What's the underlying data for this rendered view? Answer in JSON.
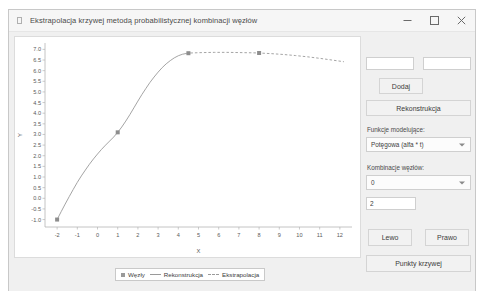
{
  "window": {
    "title": "Ekstrapolacja krzywej metodą probabilistycznej kombinacji węzłów",
    "minimize_label": "Minimalizuj",
    "maximize_label": "Maksymalizuj",
    "close_label": "Zamknij"
  },
  "controls": {
    "input_x_value": "",
    "input_x_placeholder": "",
    "input_y_value": "",
    "input_y_placeholder": "",
    "add_label": "Dodaj",
    "reconstruct_label": "Rekonstrukcja",
    "model_functions_label": "Funkcje modelujące:",
    "model_functions_selected": "Potęgowa (alfa * t)",
    "node_combinations_label": "Kombinacje węzłów:",
    "node_combinations_selected": "0",
    "count_value": "2",
    "count_placeholder": "",
    "left_label": "Lewo",
    "right_label": "Prawo",
    "curve_points_label": "Punkty krzywej"
  },
  "legend": {
    "nodes_label": "Węzły",
    "reconstruction_label": "Rekonstrukcja",
    "extrapolation_label": "Ekstrapolacja"
  },
  "colors": {
    "curve": "#9a9a9a",
    "marker": "#8d8d8d",
    "panel": "#f0f0f0",
    "plot_background": "#ffffff",
    "axis_text": "#5a5a5a"
  },
  "chart_data": {
    "type": "line",
    "title": "",
    "xlabel": "X",
    "ylabel": "Y",
    "xlim": [
      -2.6,
      12.6
    ],
    "ylim": [
      -1.35,
      7.3
    ],
    "xticks": [
      -2,
      -1,
      0,
      1,
      2,
      3,
      4,
      5,
      6,
      7,
      8,
      9,
      10,
      11,
      12
    ],
    "yticks": [
      7.0,
      6.5,
      6.0,
      5.5,
      5.0,
      4.5,
      4.0,
      3.5,
      3.0,
      2.5,
      2.0,
      1.5,
      1.0,
      0.5,
      0.0,
      -0.5,
      -1.0
    ],
    "grid": false,
    "legend_position": "bottom",
    "series": [
      {
        "name": "Rekonstrukcja",
        "style": "solid",
        "x": [
          -2.0,
          -1.8,
          -1.6,
          -1.4,
          -1.2,
          -1.0,
          -0.8,
          -0.6,
          -0.4,
          -0.2,
          0.0,
          0.2,
          0.4,
          0.6,
          0.8,
          1.0,
          1.2,
          1.4,
          1.6,
          1.8,
          2.0,
          2.2,
          2.4,
          2.6,
          2.8,
          3.0,
          3.2,
          3.4,
          3.6,
          3.8,
          4.0,
          4.2,
          4.4,
          4.6
        ],
        "y": [
          -1.0,
          -0.63,
          -0.27,
          0.08,
          0.42,
          0.75,
          1.05,
          1.33,
          1.6,
          1.85,
          2.08,
          2.3,
          2.5,
          2.69,
          2.88,
          3.1,
          3.35,
          3.63,
          3.93,
          4.25,
          4.57,
          4.88,
          5.17,
          5.45,
          5.7,
          5.93,
          6.14,
          6.32,
          6.47,
          6.6,
          6.7,
          6.77,
          6.81,
          6.83
        ]
      },
      {
        "name": "Ekstrapolacja",
        "style": "dashed",
        "x": [
          4.6,
          5.2,
          5.8,
          6.4,
          7.0,
          7.6,
          8.0,
          8.6,
          9.2,
          9.8,
          10.4,
          11.0,
          11.6,
          12.2
        ],
        "y": [
          6.83,
          6.85,
          6.86,
          6.86,
          6.85,
          6.84,
          6.83,
          6.8,
          6.76,
          6.71,
          6.65,
          6.58,
          6.5,
          6.42
        ]
      }
    ],
    "nodes": {
      "name": "Węzły",
      "x": [
        -2.0,
        1.0,
        4.5,
        8.0
      ],
      "y": [
        -1.0,
        3.1,
        6.82,
        6.83
      ]
    }
  }
}
